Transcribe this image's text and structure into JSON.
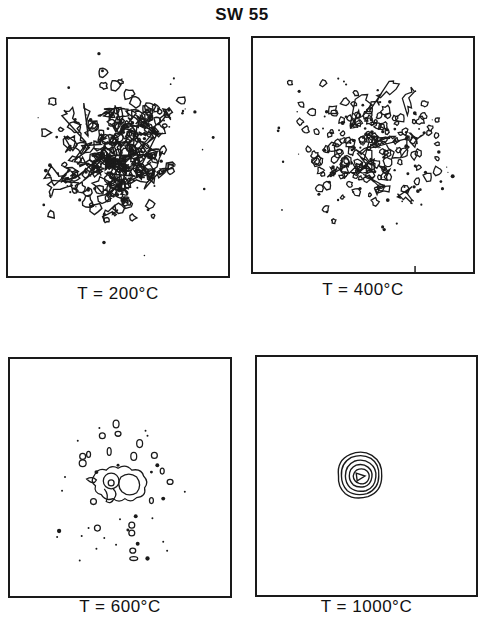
{
  "figure": {
    "title": "SW 55",
    "panels": [
      {
        "id": "p1",
        "caption": "T = 200°C",
        "pattern": "dense speckle contours over wide area"
      },
      {
        "id": "p2",
        "caption": "T = 400°C",
        "pattern": "scattered small contour islands"
      },
      {
        "id": "p3",
        "caption": "T = 600°C",
        "pattern": "sparse islands with small central cluster"
      },
      {
        "id": "p4",
        "caption": "T = 1000°C",
        "pattern": "single compact concentric contour peak"
      }
    ]
  },
  "colors": {
    "ink": "#1a1a1a",
    "background": "#ffffff"
  }
}
